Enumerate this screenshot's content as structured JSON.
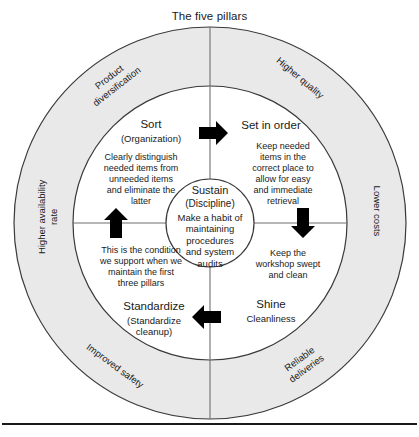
{
  "diagram": {
    "title": "The five pillars",
    "colors": {
      "ring_fill": "#e9e9e9",
      "stroke": "#3a3a3a",
      "arrow": "#000000",
      "text": "#1a1a1a",
      "background": "#ffffff"
    }
  },
  "outer_ring": {
    "labels": [
      {
        "id": "product-diversification",
        "text": "Product\ndiversification"
      },
      {
        "id": "higher-quality",
        "text": "Higher quality"
      },
      {
        "id": "lower-costs",
        "text": "Lower costs"
      },
      {
        "id": "reliable-deliveries",
        "text": "Reliable\ndeliveries"
      },
      {
        "id": "improved-safety",
        "text": "Improved safety"
      },
      {
        "id": "higher-availability-rate",
        "text": "Higher availability\nrate"
      }
    ]
  },
  "pillars": [
    {
      "id": "sort",
      "name": "Sort",
      "subtitle": "(Organization)",
      "description": "Clearly distinguish\nneeded items from\nunneeded items\nand eliminate the\nlatter"
    },
    {
      "id": "set-in-order",
      "name": "Set in order",
      "subtitle": "",
      "description": "Keep needed\nitems in the\ncorrect place to\nallow for easy\nand immediate\nretrieval"
    },
    {
      "id": "shine",
      "name": "Shine",
      "subtitle": "Cleanliness",
      "description": "Keep the\nworkshop swept\nand clean"
    },
    {
      "id": "standardize",
      "name": "Standardize",
      "subtitle": "(Standardize\ncleanup)",
      "description": "This is the condition\nwe support when we\nmaintain the first\nthree pillars"
    }
  ],
  "center": {
    "id": "sustain",
    "name": "Sustain",
    "subtitle": "(Discipline)",
    "description": "Make a habit of\nmaintaining\nprocedures\nand system\naudits"
  },
  "arrows": [
    {
      "id": "arrow-top",
      "direction": "right"
    },
    {
      "id": "arrow-right",
      "direction": "down"
    },
    {
      "id": "arrow-bottom",
      "direction": "left"
    },
    {
      "id": "arrow-left",
      "direction": "up"
    }
  ]
}
